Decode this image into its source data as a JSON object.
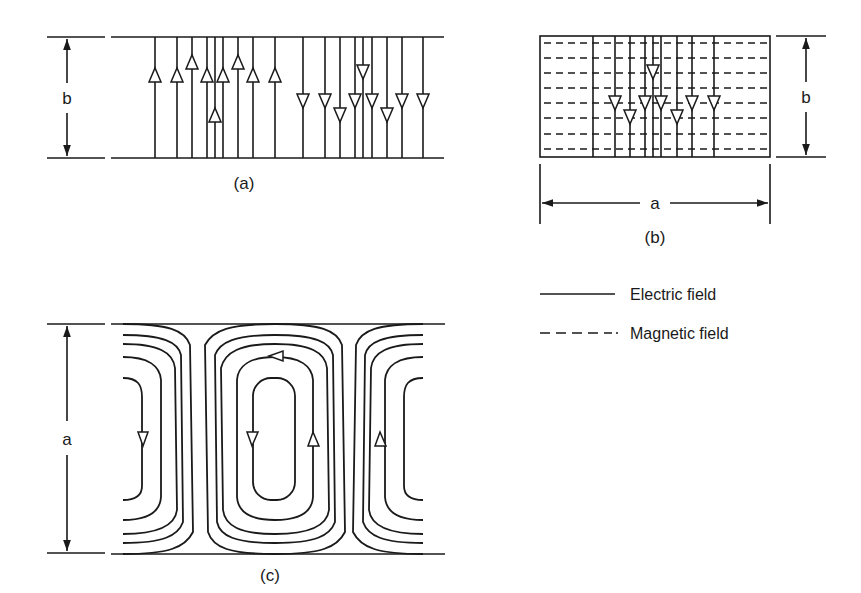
{
  "figure": {
    "panel_a": {
      "caption": "(a)",
      "dimension_label": "b",
      "top_y": 37,
      "bottom_y": 158,
      "x_start": 111,
      "x_end": 444,
      "up_lines": [
        {
          "x": 155,
          "arrow_y": 75
        },
        {
          "x": 177,
          "arrow_y": 75
        },
        {
          "x": 192,
          "arrow_y": 62
        },
        {
          "x": 207,
          "arrow_y": 75
        },
        {
          "x": 215,
          "arrow_y": 115
        },
        {
          "x": 223,
          "arrow_y": 75
        },
        {
          "x": 238,
          "arrow_y": 62
        },
        {
          "x": 253,
          "arrow_y": 75
        },
        {
          "x": 275,
          "arrow_y": 75
        }
      ],
      "down_lines": [
        {
          "x": 303,
          "arrow_y": 101
        },
        {
          "x": 325,
          "arrow_y": 101
        },
        {
          "x": 340,
          "arrow_y": 115
        },
        {
          "x": 355,
          "arrow_y": 101
        },
        {
          "x": 363,
          "arrow_y": 72
        },
        {
          "x": 372,
          "arrow_y": 101
        },
        {
          "x": 387,
          "arrow_y": 115
        },
        {
          "x": 402,
          "arrow_y": 101
        },
        {
          "x": 423,
          "arrow_y": 101
        }
      ]
    },
    "panel_b": {
      "caption": "(b)",
      "width_label": "a",
      "height_label": "b",
      "box": {
        "x1": 540,
        "y1": 36,
        "x2": 770,
        "y2": 157
      },
      "electric_lines": [
        {
          "x": 593,
          "arrow_y": null
        },
        {
          "x": 615,
          "arrow_y": 103
        },
        {
          "x": 630,
          "arrow_y": 117
        },
        {
          "x": 645,
          "arrow_y": 103
        },
        {
          "x": 653,
          "arrow_y": 72
        },
        {
          "x": 661,
          "arrow_y": 103
        },
        {
          "x": 677,
          "arrow_y": 117
        },
        {
          "x": 692,
          "arrow_y": 103
        },
        {
          "x": 714,
          "arrow_y": 103
        }
      ],
      "magnetic_y": [
        43,
        58,
        73,
        88,
        103,
        118,
        134,
        149
      ]
    },
    "panel_c": {
      "caption": "(c)",
      "dimension_label": "a",
      "top_y": 324,
      "bottom_y": 553,
      "x_start": 111,
      "x_end": 445
    },
    "legend": {
      "items": [
        {
          "label": "Electric field",
          "style": "solid"
        },
        {
          "label": "Magnetic field",
          "style": "dashed"
        }
      ]
    }
  }
}
